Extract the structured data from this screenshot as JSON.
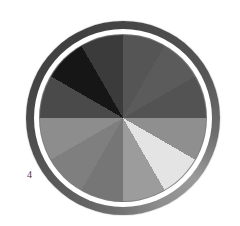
{
  "page": {
    "background": "#ffffff",
    "figure_label": "4"
  },
  "wheel": {
    "type": "grayscale-color-wheel",
    "description": "12-sector color wheel plate printed in halftone gray",
    "center_x": 123,
    "center_y": 118,
    "outer_radius": 97,
    "ring": {
      "white_ring_color": "#ffffff",
      "inner_line_color": "#7d7d7d",
      "shading_stops": [
        {
          "angle": 0,
          "color": "#464646"
        },
        {
          "angle": 60,
          "color": "#555555"
        },
        {
          "angle": 100,
          "color": "#6e6e6e"
        },
        {
          "angle": 130,
          "color": "#9a9a9a"
        },
        {
          "angle": 155,
          "color": "#8f8f8f"
        },
        {
          "angle": 185,
          "color": "#6f6f6f"
        },
        {
          "angle": 215,
          "color": "#5e5e5e"
        },
        {
          "angle": 255,
          "color": "#4f4f4f"
        },
        {
          "angle": 295,
          "color": "#434343"
        },
        {
          "angle": 330,
          "color": "#3f3f3f"
        },
        {
          "angle": 360,
          "color": "#464646"
        }
      ]
    },
    "segments": [
      {
        "start_deg": 0,
        "end_deg": 30,
        "color": "#555555"
      },
      {
        "start_deg": 30,
        "end_deg": 60,
        "color": "#5b5b5b"
      },
      {
        "start_deg": 60,
        "end_deg": 90,
        "color": "#535353"
      },
      {
        "start_deg": 90,
        "end_deg": 120,
        "color": "#8f8f8f"
      },
      {
        "start_deg": 120,
        "end_deg": 150,
        "color": "#e4e4e4"
      },
      {
        "start_deg": 150,
        "end_deg": 180,
        "color": "#9c9c9c"
      },
      {
        "start_deg": 180,
        "end_deg": 210,
        "color": "#767676"
      },
      {
        "start_deg": 210,
        "end_deg": 240,
        "color": "#7f7f7f"
      },
      {
        "start_deg": 240,
        "end_deg": 270,
        "color": "#8d8d8d"
      },
      {
        "start_deg": 270,
        "end_deg": 300,
        "color": "#4a4a4a"
      },
      {
        "start_deg": 300,
        "end_deg": 330,
        "color": "#161616"
      },
      {
        "start_deg": 330,
        "end_deg": 360,
        "color": "#3b3b3b"
      }
    ]
  }
}
